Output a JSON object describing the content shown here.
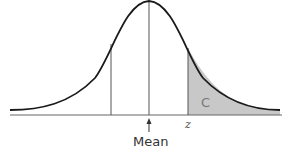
{
  "diagram": {
    "type": "normal-distribution-curve",
    "shaded_region_label": "C",
    "z_label": "z",
    "mean_label": "Mean",
    "colors": {
      "curve": "#1a1a1a",
      "lines": "#555555",
      "shade": "#c8c8c8"
    }
  }
}
